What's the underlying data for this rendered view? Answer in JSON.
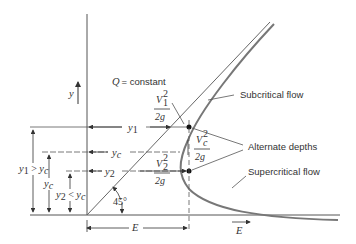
{
  "diagram": {
    "axes": {
      "y_label": "y",
      "x_label": "E"
    },
    "annotations": {
      "q_constant": "Q = constant",
      "subcritical": "Subcritical flow",
      "supercritical": "Supercritical flow",
      "alternate_depths": "Alternate depths",
      "angle": "45°",
      "v1_num": "V",
      "v1_sub": "1",
      "v1_sup": "2",
      "vc_sub": "c",
      "v2_sub": "2",
      "two_g": "2g",
      "y1": "y",
      "y1_sub": "1",
      "yc": "y",
      "yc_sub": "c",
      "y2": "y",
      "y2_sub": "2",
      "y1_gt": "y",
      "y1_gt_sub": "1",
      "gt": " > y",
      "lt": " < y",
      "c_sub": "c",
      "e_bottom": "E"
    }
  }
}
